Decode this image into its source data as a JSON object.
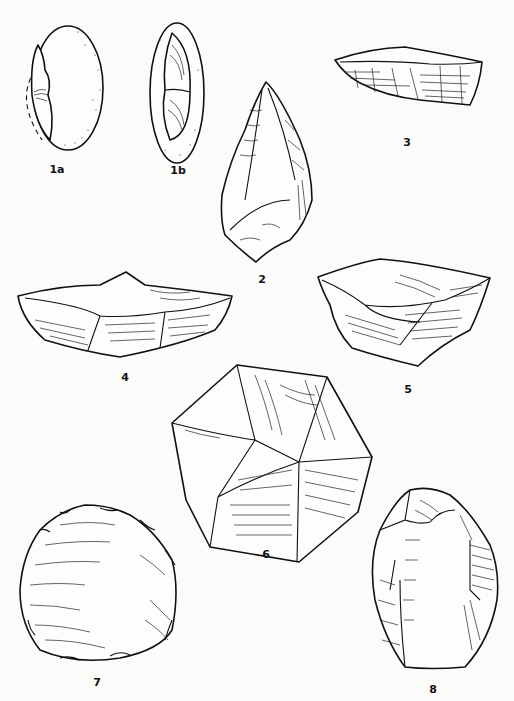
{
  "figure": {
    "type": "archaeological stone tool illustration plate",
    "background": "#fbfbfa",
    "ink": "#111111",
    "items": [
      {
        "id": "1a",
        "label": "1a",
        "description": "pebble with flake removal (side view, stippled cortex)"
      },
      {
        "id": "1b",
        "label": "1b",
        "description": "pebble with two flake scars (face view, stippled cortex)"
      },
      {
        "id": "2",
        "label": "2",
        "description": "pointed biface / hand-axe"
      },
      {
        "id": "3",
        "label": "3",
        "description": "elongated core (side view)"
      },
      {
        "id": "4",
        "label": "4",
        "description": "flat prepared core (side view)"
      },
      {
        "id": "5",
        "label": "5",
        "description": "prepared core (oblique view)"
      },
      {
        "id": "6",
        "label": "6",
        "description": "polyhedral core"
      },
      {
        "id": "7",
        "label": "7",
        "description": "rounded scraper with retouched edge"
      },
      {
        "id": "8",
        "label": "8",
        "description": "oval retouched scraper"
      }
    ]
  }
}
